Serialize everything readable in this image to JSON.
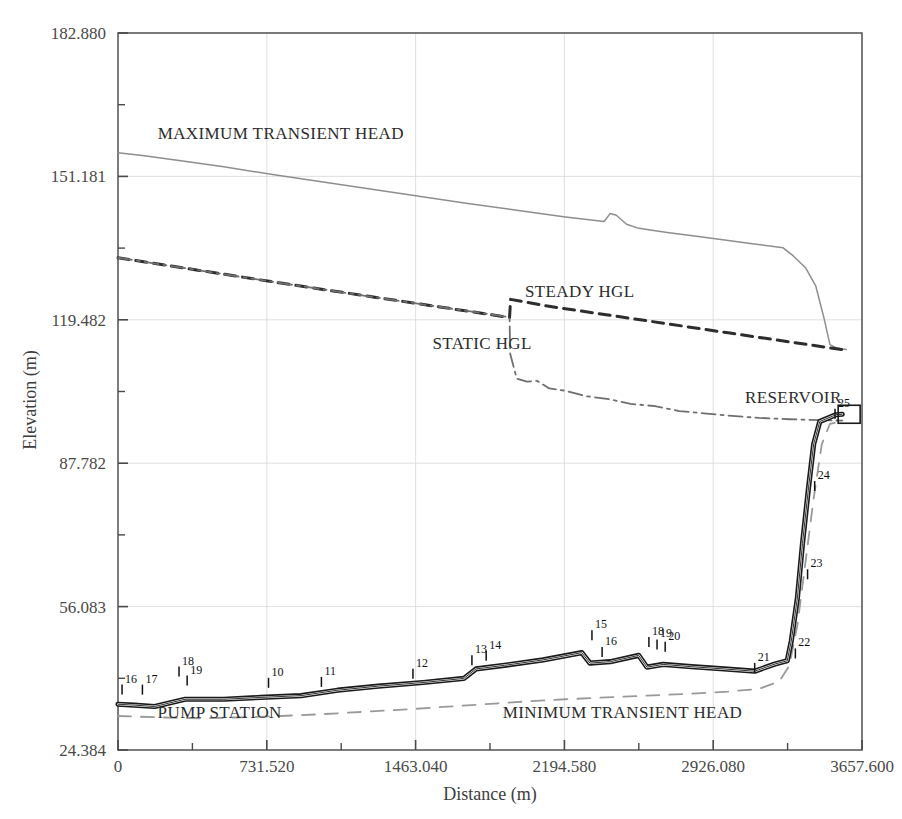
{
  "chart_data": {
    "type": "line",
    "title": "",
    "xlabel": "Distance (m)",
    "ylabel": "Elevation (m)",
    "xlim": [
      0,
      3657.6
    ],
    "ylim": [
      24.384,
      182.88
    ],
    "grid": true,
    "legend_position": "inline-annotations",
    "x_ticks": [
      "0",
      "731.520",
      "1463.040",
      "2194.580",
      "2926.080",
      "3657.600"
    ],
    "x_tick_values": [
      0,
      731.52,
      1463.04,
      2194.58,
      2926.08,
      3657.6
    ],
    "y_ticks": [
      "24.384",
      "56.083",
      "87.782",
      "119.482",
      "151.181",
      "182.880"
    ],
    "y_tick_values": [
      24.384,
      56.083,
      87.782,
      119.482,
      151.181,
      182.88
    ],
    "annotations": [
      {
        "text": "MAXIMUM TRANSIENT HEAD",
        "x": 800,
        "y": 159.5
      },
      {
        "text": "STEADY HGL",
        "x": 2270,
        "y": 124.5
      },
      {
        "text": "STATIC HGL",
        "x": 1790,
        "y": 113.0
      },
      {
        "text": "RESERVOIR",
        "x": 3320,
        "y": 101.0
      },
      {
        "text": "PUMP STATION",
        "x": 500,
        "y": 31.5
      },
      {
        "text": "MINIMUM TRANSIENT HEAD",
        "x": 2480,
        "y": 31.5
      }
    ],
    "series": [
      {
        "name": "MAXIMUM TRANSIENT HEAD",
        "style": "solid-thin",
        "color": "#8e8e8e",
        "points": [
          [
            0,
            156.4
          ],
          [
            120,
            155.8
          ],
          [
            300,
            154.7
          ],
          [
            520,
            153.3
          ],
          [
            760,
            151.6
          ],
          [
            1000,
            150.0
          ],
          [
            1240,
            148.4
          ],
          [
            1480,
            146.8
          ],
          [
            1720,
            145.2
          ],
          [
            1960,
            143.7
          ],
          [
            2200,
            142.2
          ],
          [
            2390,
            141.2
          ],
          [
            2420,
            143.0
          ],
          [
            2450,
            142.6
          ],
          [
            2500,
            140.6
          ],
          [
            2560,
            139.7
          ],
          [
            2700,
            138.8
          ],
          [
            2900,
            137.6
          ],
          [
            3100,
            136.4
          ],
          [
            3270,
            135.4
          ],
          [
            3320,
            133.6
          ],
          [
            3380,
            131.0
          ],
          [
            3430,
            127.0
          ],
          [
            3470,
            120.0
          ],
          [
            3500,
            114.0
          ],
          [
            3530,
            113.3
          ],
          [
            3560,
            113.0
          ],
          [
            3580,
            112.9
          ]
        ]
      },
      {
        "name": "STEADY HGL",
        "style": "dashed",
        "color": "#2d2d2d",
        "points": [
          [
            0,
            133.2
          ],
          [
            400,
            130.4
          ],
          [
            800,
            127.6
          ],
          [
            1200,
            124.9
          ],
          [
            1600,
            122.2
          ],
          [
            1925,
            120.0
          ],
          [
            1930,
            124.0
          ],
          [
            2100,
            122.6
          ],
          [
            2400,
            120.6
          ],
          [
            2700,
            118.6
          ],
          [
            3000,
            116.6
          ],
          [
            3300,
            114.6
          ],
          [
            3560,
            112.9
          ],
          [
            3580,
            112.7
          ]
        ]
      },
      {
        "name": "STATIC HGL",
        "style": "dash-dot",
        "color": "#6f6f6f",
        "points": [
          [
            0,
            133.2
          ],
          [
            400,
            130.4
          ],
          [
            800,
            127.6
          ],
          [
            1200,
            124.9
          ],
          [
            1600,
            122.2
          ],
          [
            1905,
            120.2
          ],
          [
            1925,
            120.0
          ],
          [
            1928,
            112.0
          ],
          [
            1960,
            106.5
          ],
          [
            2010,
            105.8
          ],
          [
            2060,
            106.0
          ],
          [
            2120,
            104.3
          ],
          [
            2200,
            103.8
          ],
          [
            2300,
            102.6
          ],
          [
            2420,
            101.9
          ],
          [
            2520,
            100.9
          ],
          [
            2640,
            100.4
          ],
          [
            2760,
            99.3
          ],
          [
            2880,
            98.8
          ],
          [
            3000,
            98.3
          ],
          [
            3150,
            97.8
          ],
          [
            3300,
            97.5
          ],
          [
            3450,
            97.3
          ],
          [
            3560,
            97.2
          ]
        ]
      },
      {
        "name": "MINIMUM TRANSIENT HEAD",
        "style": "dashed-light",
        "color": "#9a9a9a",
        "points": [
          [
            0,
            31.9
          ],
          [
            200,
            31.6
          ],
          [
            400,
            31.4
          ],
          [
            600,
            31.6
          ],
          [
            800,
            31.9
          ],
          [
            1000,
            32.3
          ],
          [
            1200,
            32.8
          ],
          [
            1400,
            33.3
          ],
          [
            1600,
            33.9
          ],
          [
            1800,
            34.5
          ],
          [
            2000,
            35.1
          ],
          [
            2200,
            35.6
          ],
          [
            2400,
            36.0
          ],
          [
            2600,
            36.4
          ],
          [
            2800,
            36.8
          ],
          [
            3000,
            37.3
          ],
          [
            3150,
            37.9
          ],
          [
            3250,
            39.5
          ],
          [
            3300,
            43.0
          ],
          [
            3340,
            52.0
          ],
          [
            3380,
            66.0
          ],
          [
            3420,
            80.0
          ],
          [
            3460,
            92.0
          ],
          [
            3500,
            96.5
          ],
          [
            3560,
            97.0
          ]
        ]
      },
      {
        "name": "PIPELINE PROFILE",
        "style": "solid-thick-double",
        "color": "#1a1a1a",
        "points": [
          [
            0,
            34.5
          ],
          [
            80,
            34.3
          ],
          [
            180,
            34.0
          ],
          [
            330,
            35.6
          ],
          [
            520,
            35.6
          ],
          [
            700,
            36.0
          ],
          [
            900,
            36.4
          ],
          [
            1080,
            37.6
          ],
          [
            1280,
            38.5
          ],
          [
            1500,
            39.3
          ],
          [
            1700,
            40.2
          ],
          [
            1760,
            42.3
          ],
          [
            1900,
            43.1
          ],
          [
            2090,
            44.3
          ],
          [
            2280,
            45.9
          ],
          [
            2320,
            43.6
          ],
          [
            2420,
            43.9
          ],
          [
            2560,
            45.3
          ],
          [
            2600,
            42.7
          ],
          [
            2680,
            43.3
          ],
          [
            2820,
            42.8
          ],
          [
            2980,
            42.3
          ],
          [
            3130,
            41.8
          ],
          [
            3230,
            43.4
          ],
          [
            3290,
            44.1
          ],
          [
            3310,
            48.5
          ],
          [
            3340,
            58.0
          ],
          [
            3365,
            70.0
          ],
          [
            3395,
            82.5
          ],
          [
            3420,
            92.0
          ],
          [
            3450,
            97.0
          ],
          [
            3530,
            98.5
          ],
          [
            3560,
            98.6
          ]
        ]
      }
    ],
    "nodes": [
      {
        "label": "16",
        "x": 20,
        "y": 39.5
      },
      {
        "label": "17",
        "x": 120,
        "y": 39.5
      },
      {
        "label": "18",
        "x": 300,
        "y": 43.5
      },
      {
        "label": "19",
        "x": 340,
        "y": 41.5
      },
      {
        "label": "10",
        "x": 740,
        "y": 41.0
      },
      {
        "label": "11",
        "x": 1000,
        "y": 41.2
      },
      {
        "label": "12",
        "x": 1450,
        "y": 43.0
      },
      {
        "label": "13",
        "x": 1740,
        "y": 46.0
      },
      {
        "label": "14",
        "x": 1810,
        "y": 47.0
      },
      {
        "label": "15",
        "x": 2330,
        "y": 51.5
      },
      {
        "label": "16",
        "x": 2380,
        "y": 47.8
      },
      {
        "label": "18",
        "x": 2610,
        "y": 50.0
      },
      {
        "label": "19",
        "x": 2650,
        "y": 49.5
      },
      {
        "label": "20",
        "x": 2690,
        "y": 49.0
      },
      {
        "label": "21",
        "x": 3130,
        "y": 44.3
      },
      {
        "label": "22",
        "x": 3330,
        "y": 47.5
      },
      {
        "label": "23",
        "x": 3390,
        "y": 65.0
      },
      {
        "label": "24",
        "x": 3425,
        "y": 84.5
      },
      {
        "label": "25",
        "x": 3525,
        "y": 100.5
      }
    ]
  }
}
